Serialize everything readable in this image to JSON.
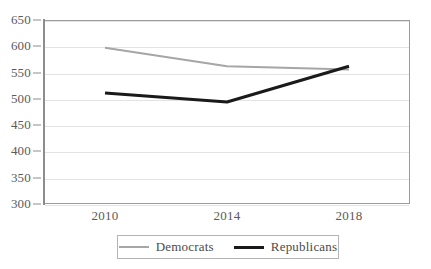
{
  "chart_data": {
    "type": "line",
    "title": "",
    "subtitle": "",
    "xlabel": "",
    "ylabel": "",
    "categories": [
      "2010",
      "2014",
      "2018"
    ],
    "x": [
      2010,
      2014,
      2018
    ],
    "series": [
      {
        "name": "Democrats",
        "values": [
          597,
          562,
          556
        ],
        "color": "#a6a6a6",
        "line_width": 2
      },
      {
        "name": "Republicans",
        "values": [
          511,
          494,
          562
        ],
        "color": "#1a1a1a",
        "line_width": 3
      }
    ],
    "ylim": [
      300,
      650
    ],
    "ytick_step": 50,
    "yticks": [
      650,
      600,
      550,
      500,
      450,
      400,
      350,
      300
    ],
    "ytick_labels": [
      "650",
      "600",
      "550",
      "500",
      "450",
      "400",
      "350",
      "300"
    ],
    "xtick_labels": [
      "2010",
      "2014",
      "2018"
    ],
    "grid": true,
    "grid_axis": "y",
    "legend": {
      "position": "bottom-center",
      "bordered": true,
      "entries": [
        {
          "label": "Democrats",
          "marker": "line-swatch-gray"
        },
        {
          "label": "Republicans",
          "marker": "line-swatch-black"
        }
      ]
    },
    "colors": {
      "democrats": "#a6a6a6",
      "republicans": "#1a1a1a",
      "gridline": "#e3e3e3",
      "frame": "#9c9c9c",
      "text": "#4a4a4a",
      "background": "#ffffff"
    }
  }
}
